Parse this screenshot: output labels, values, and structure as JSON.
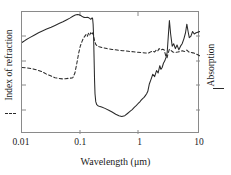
{
  "chart_data": {
    "type": "line",
    "title": "",
    "xlabel": "Wavelength (μm)",
    "ylabel_left": "Index of refraction",
    "ylabel_right": "Absorption",
    "xscale": "log",
    "xlim": [
      0.01,
      10
    ],
    "xticks": [
      0.01,
      0.1,
      1,
      10
    ],
    "xtick_labels": [
      "0.01",
      "0.1",
      "1",
      "10"
    ],
    "yticks_left": [],
    "ytick_labels_left": [],
    "yticks_right": [],
    "ytick_labels_right": [],
    "grid": false,
    "legend_position": "axis-labels",
    "series": [
      {
        "name": "Absorption",
        "axis": "right",
        "style": "solid",
        "color": "#2a2a2a",
        "legend_key": "solid-line",
        "x": [
          0.01,
          0.0115,
          0.0135,
          0.016,
          0.019,
          0.022,
          0.026,
          0.031,
          0.036,
          0.042,
          0.049,
          0.056,
          0.064,
          0.072,
          0.079,
          0.086,
          0.092,
          0.097,
          0.102,
          0.108,
          0.114,
          0.12,
          0.126,
          0.131,
          0.136,
          0.14,
          0.144,
          0.148,
          0.152,
          0.155,
          0.158,
          0.161,
          0.164,
          0.167,
          0.17,
          0.175,
          0.182,
          0.19,
          0.2,
          0.22,
          0.25,
          0.29,
          0.33,
          0.38,
          0.43,
          0.48,
          0.54,
          0.6,
          0.66,
          0.72,
          0.78,
          0.84,
          0.9,
          0.96,
          1.02,
          1.08,
          1.14,
          1.2,
          1.26,
          1.32,
          1.4,
          1.5,
          1.6,
          1.72,
          1.85,
          1.97,
          2.1,
          2.2,
          2.3,
          2.42,
          2.55,
          2.68,
          2.8,
          2.92,
          3.05,
          3.2,
          3.4,
          3.6,
          3.85,
          4.1,
          4.4,
          4.7,
          5.0,
          5.35,
          5.7,
          6.0,
          6.3,
          6.6,
          7.0,
          7.5,
          8.0,
          8.6,
          9.2,
          10.0
        ],
        "y": [
          0.75,
          0.77,
          0.79,
          0.81,
          0.83,
          0.845,
          0.86,
          0.875,
          0.89,
          0.905,
          0.92,
          0.935,
          0.95,
          0.965,
          0.975,
          0.98,
          0.978,
          0.972,
          0.965,
          0.958,
          0.955,
          0.955,
          0.956,
          0.955,
          0.95,
          0.945,
          0.94,
          0.945,
          0.952,
          0.945,
          0.9,
          0.8,
          0.62,
          0.44,
          0.33,
          0.265,
          0.24,
          0.232,
          0.228,
          0.222,
          0.21,
          0.195,
          0.18,
          0.162,
          0.15,
          0.143,
          0.15,
          0.168,
          0.185,
          0.2,
          0.218,
          0.232,
          0.248,
          0.262,
          0.277,
          0.29,
          0.3,
          0.315,
          0.33,
          0.35,
          0.41,
          0.45,
          0.49,
          0.47,
          0.52,
          0.5,
          0.56,
          0.53,
          0.545,
          0.58,
          0.6,
          0.63,
          0.67,
          0.8,
          0.93,
          0.82,
          0.72,
          0.74,
          0.7,
          0.73,
          0.69,
          0.72,
          0.74,
          0.78,
          0.83,
          0.9,
          0.84,
          0.79,
          0.8,
          0.84,
          0.82,
          0.83,
          0.835,
          0.84
        ]
      },
      {
        "name": "Index of refraction",
        "axis": "left",
        "style": "dashed",
        "color": "#2a2a2a",
        "legend_key": "dashed-line",
        "x": [
          0.01,
          0.012,
          0.015,
          0.018,
          0.022,
          0.026,
          0.031,
          0.036,
          0.042,
          0.048,
          0.054,
          0.06,
          0.066,
          0.072,
          0.078,
          0.084,
          0.09,
          0.096,
          0.102,
          0.108,
          0.114,
          0.12,
          0.126,
          0.132,
          0.138,
          0.144,
          0.15,
          0.156,
          0.162,
          0.168,
          0.175,
          0.185,
          0.2,
          0.23,
          0.27,
          0.33,
          0.4,
          0.5,
          0.62,
          0.75,
          0.9,
          1.05,
          1.2,
          1.35,
          1.5,
          1.6,
          1.72,
          1.85,
          1.95,
          2.05,
          2.2,
          2.35,
          2.5,
          2.65,
          2.78,
          2.9,
          3.05,
          3.25,
          3.5,
          3.8,
          4.2,
          4.6,
          5.0,
          5.5,
          6.0,
          6.5,
          7.0,
          7.6,
          8.2,
          9.0,
          10.0
        ],
        "y": [
          0.545,
          0.542,
          0.535,
          0.525,
          0.51,
          0.49,
          0.475,
          0.462,
          0.455,
          0.452,
          0.453,
          0.456,
          0.458,
          0.462,
          0.5,
          0.58,
          0.66,
          0.72,
          0.755,
          0.785,
          0.8,
          0.815,
          0.8,
          0.825,
          0.81,
          0.83,
          0.815,
          0.83,
          0.795,
          0.76,
          0.735,
          0.722,
          0.715,
          0.708,
          0.7,
          0.693,
          0.688,
          0.683,
          0.678,
          0.674,
          0.67,
          0.667,
          0.664,
          0.663,
          0.675,
          0.68,
          0.672,
          0.69,
          0.682,
          0.7,
          0.688,
          0.695,
          0.688,
          0.64,
          0.625,
          0.66,
          0.695,
          0.685,
          0.672,
          0.668,
          0.672,
          0.676,
          0.682,
          0.676,
          0.688,
          0.672,
          0.668,
          0.665,
          0.66,
          0.652,
          0.64
        ]
      }
    ]
  }
}
